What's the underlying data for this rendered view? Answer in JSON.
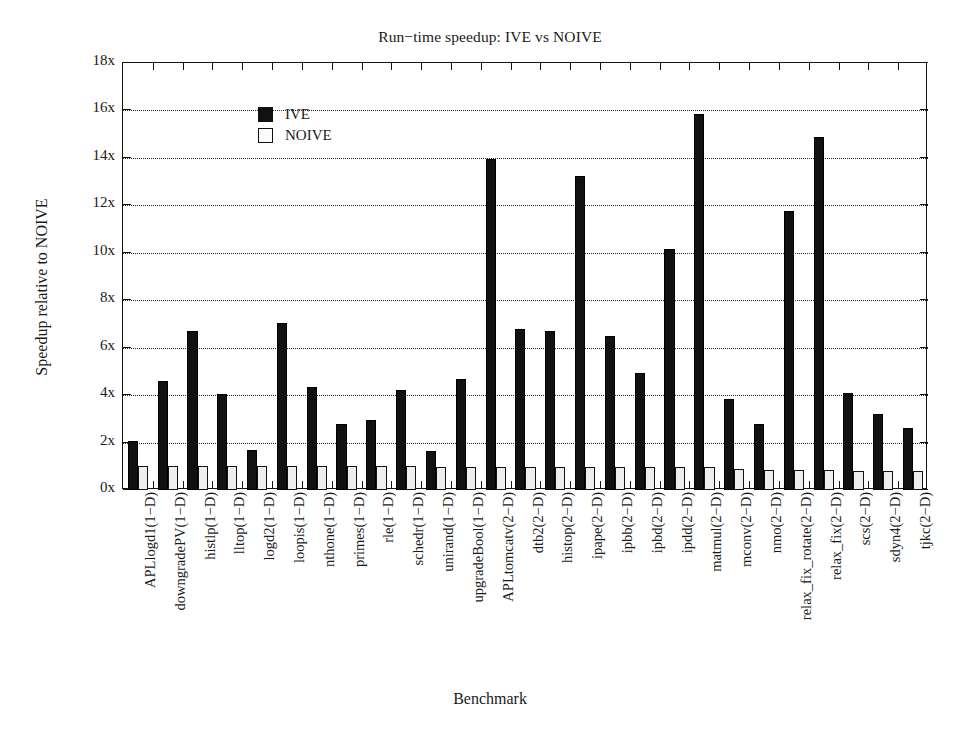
{
  "chart_data": {
    "type": "bar",
    "title": "Run−time speedup: IVE vs NOIVE",
    "xlabel": "Benchmark",
    "ylabel": "Speedup relative to NOIVE",
    "ylim": [
      0,
      18
    ],
    "ytick_labels": [
      "0x",
      "2x",
      "4x",
      "6x",
      "8x",
      "10x",
      "12x",
      "14x",
      "16x",
      "18x"
    ],
    "ytick_values": [
      0,
      2,
      4,
      6,
      8,
      10,
      12,
      14,
      16,
      18
    ],
    "grid": "horizontal-dotted",
    "legend_position": "upper-left-inside",
    "categories": [
      "APLlogd1(1−D)",
      "downgradePV(1−D)",
      "histlp(1−D)",
      "lltop(1−D)",
      "logd2(1−D)",
      "loopis(1−D)",
      "nthone(1−D)",
      "primes(1−D)",
      "rle(1−D)",
      "schedr(1−D)",
      "unirand(1−D)",
      "upgradeBool(1−D)",
      "APLtomcatv(2−D)",
      "dtb2(2−D)",
      "histop(2−D)",
      "ipape(2−D)",
      "ipbb(2−D)",
      "ipbd(2−D)",
      "ipdd(2−D)",
      "matmul(2−D)",
      "mconv(2−D)",
      "nmo(2−D)",
      "relax_fix_rotate(2−D)",
      "relax_fix(2−D)",
      "scs(2−D)",
      "sdyn4(2−D)",
      "tjkc(2−D)"
    ],
    "series": [
      {
        "name": "IVE",
        "color": "#111111",
        "values": [
          2.05,
          4.6,
          6.7,
          4.05,
          1.7,
          7.05,
          4.35,
          2.8,
          2.95,
          4.2,
          1.65,
          4.7,
          13.95,
          6.8,
          6.7,
          13.25,
          6.5,
          4.95,
          10.15,
          15.85,
          3.85,
          2.8,
          11.75,
          14.9,
          4.1,
          3.2,
          2.6
        ]
      },
      {
        "name": "NOIVE",
        "color": "#eeeeec",
        "values": [
          1.0,
          1.0,
          1.0,
          1.0,
          1.0,
          1.0,
          1.0,
          1.0,
          1.0,
          1.0,
          0.95,
          0.95,
          0.95,
          0.95,
          0.95,
          0.95,
          0.95,
          0.95,
          0.95,
          0.95,
          0.9,
          0.85,
          0.85,
          0.85,
          0.8,
          0.8,
          0.8
        ]
      }
    ]
  },
  "legend": {
    "items": [
      {
        "label": "IVE",
        "style": "filled"
      },
      {
        "label": "NOIVE",
        "style": "hollow"
      }
    ]
  }
}
